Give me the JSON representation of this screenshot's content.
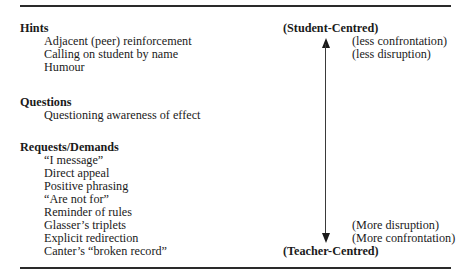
{
  "table": {
    "sections": [
      {
        "heading": "Hints",
        "items": [
          "Adjacent (peer) reinforcement",
          "Calling on student by name",
          "Humour"
        ]
      },
      {
        "heading": "Questions",
        "items": [
          "Questioning awareness of effect"
        ]
      },
      {
        "heading": "Requests/Demands",
        "items": [
          "“I message”",
          "Direct appeal",
          "Positive phrasing",
          "“Are not for”",
          "Reminder of rules",
          "Glasser’s triplets",
          "Explicit redirection",
          "Canter’s “broken record”"
        ]
      }
    ],
    "scale": {
      "top_label": "(Student-Centred)",
      "bottom_label": "(Teacher-Centred)",
      "top_notes": [
        "(less confrontation)",
        "(less disruption)"
      ],
      "bottom_notes": [
        "(More disruption)",
        "(More confrontation)"
      ],
      "arrow_icon": "double-headed-vertical-arrow"
    }
  }
}
